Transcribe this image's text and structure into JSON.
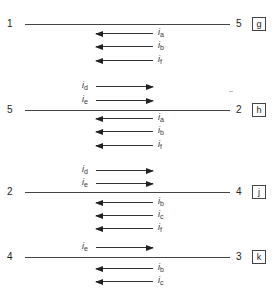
{
  "blocks": [
    {
      "id": "g",
      "left_node": "1",
      "right_node": "5",
      "box": "g",
      "line_y": 24,
      "above": [],
      "below": [
        {
          "symbol": "i",
          "sub": "a",
          "y": 33,
          "dir": "left"
        },
        {
          "symbol": "i",
          "sub": "b",
          "y": 46,
          "dir": "left"
        },
        {
          "symbol": "i",
          "sub": "f",
          "y": 60,
          "dir": "left"
        }
      ]
    },
    {
      "id": "h",
      "left_node": "5",
      "right_node": "2",
      "box": "h",
      "line_y": 110,
      "above": [
        {
          "symbol": "i",
          "sub": "d",
          "y": 86,
          "dir": "right"
        },
        {
          "symbol": "i",
          "sub": "e",
          "y": 100,
          "dir": "right"
        }
      ],
      "below": [
        {
          "symbol": "i",
          "sub": "a",
          "y": 118,
          "dir": "left"
        },
        {
          "symbol": "i",
          "sub": "b",
          "y": 131,
          "dir": "left"
        },
        {
          "symbol": "i",
          "sub": "f",
          "y": 145,
          "dir": "left"
        }
      ]
    },
    {
      "id": "j",
      "left_node": "2",
      "right_node": "4",
      "box": "j",
      "line_y": 192,
      "above": [
        {
          "symbol": "i",
          "sub": "d",
          "y": 170,
          "dir": "right"
        },
        {
          "symbol": "i",
          "sub": "e",
          "y": 183,
          "dir": "right"
        }
      ],
      "below": [
        {
          "symbol": "i",
          "sub": "b",
          "y": 202,
          "dir": "left"
        },
        {
          "symbol": "i",
          "sub": "c",
          "y": 215,
          "dir": "left"
        },
        {
          "symbol": "i",
          "sub": "f",
          "y": 228,
          "dir": "left"
        }
      ]
    },
    {
      "id": "k",
      "left_node": "4",
      "right_node": "3",
      "box": "k",
      "line_y": 257,
      "above": [
        {
          "symbol": "i",
          "sub": "e",
          "y": 247,
          "dir": "right"
        }
      ],
      "below": [
        {
          "symbol": "i",
          "sub": "b",
          "y": 268,
          "dir": "left"
        },
        {
          "symbol": "i",
          "sub": "c",
          "y": 281,
          "dir": "left"
        }
      ]
    }
  ]
}
